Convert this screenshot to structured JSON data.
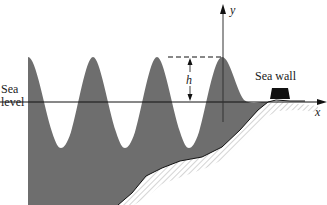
{
  "figure": {
    "labels": {
      "sea_level_line1": "Sea",
      "sea_level_line2": "level",
      "sea_wall": "Sea wall",
      "height": "h",
      "x_axis": "x",
      "y_axis": "y"
    },
    "colors": {
      "water": "#6e6e6e",
      "seabed_hatch": "#c8c8c8",
      "seabed_outline": "#111111",
      "sea_wall": "#111111",
      "axis": "#111111",
      "background": "#ffffff"
    },
    "wave": {
      "crest_count": 4,
      "crest_x_px": [
        28,
        93,
        157,
        222
      ],
      "crest_y_px": 57,
      "trough_y_px": 148,
      "sea_level_y_px": 102
    }
  }
}
